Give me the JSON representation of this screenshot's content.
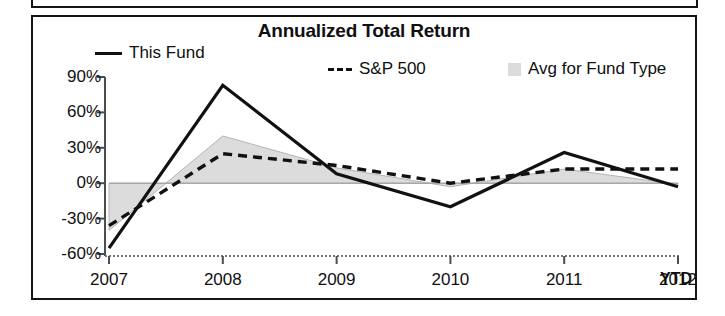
{
  "chart": {
    "title": "Annualized Total Return",
    "ytd_label": "YTD",
    "legend": [
      {
        "key": "this_fund",
        "label": "This Fund",
        "marker": "solid-line-swatch"
      },
      {
        "key": "sp500",
        "label": "S&P 500",
        "marker": "dashed-line-swatch"
      },
      {
        "key": "avg",
        "label": "Avg for Fund Type",
        "marker": "gray-square-swatch"
      }
    ]
  },
  "chart_data": {
    "type": "line",
    "title": "Annualized Total Return",
    "xlabel": "",
    "ylabel": "",
    "categories": [
      "2007",
      "2008",
      "2009",
      "2010",
      "2011",
      "2012"
    ],
    "x_tick_labels": [
      "2007",
      "2008",
      "2009",
      "2010",
      "2011",
      "2012"
    ],
    "x_axis_note": "YTD",
    "y_tick_labels": [
      "90%",
      "60%",
      "30%",
      "0%",
      "-30%",
      "-60%"
    ],
    "y_ticks": [
      90,
      60,
      30,
      0,
      -30,
      -60
    ],
    "ylim": [
      -60,
      90
    ],
    "grid": false,
    "legend_position": "top",
    "zero_line": true,
    "series": [
      {
        "name": "This Fund",
        "style": "solid",
        "color": "#111111",
        "values": [
          -55,
          83,
          8,
          -20,
          26,
          -3
        ]
      },
      {
        "name": "S&P 500",
        "style": "dashed",
        "color": "#111111",
        "values": [
          -36,
          25,
          15,
          0,
          12,
          12
        ]
      },
      {
        "name": "Avg for Fund Type",
        "style": "area",
        "color": "#dcdcdc",
        "values": [
          -40,
          40,
          13,
          -3,
          12,
          -1
        ]
      }
    ]
  },
  "colors": {
    "frame": "#141414",
    "series_line": "#111111",
    "area_fill": "#dcdcdc",
    "area_edge": "#b4b4b4",
    "background": "#ffffff"
  }
}
